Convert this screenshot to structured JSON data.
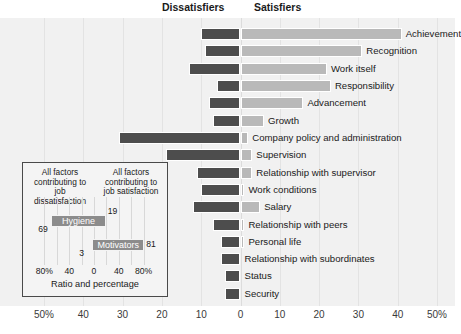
{
  "headers": {
    "dissatisfiers": "Dissatisfiers",
    "satisfiers": "Satisfiers"
  },
  "colors": {
    "negative_bar": "#4d4d4d",
    "positive_bar": "#b9b9b9",
    "plot_background": "#f1f1f1",
    "inset_bar": "#8c8c8c"
  },
  "chart_data": {
    "type": "bar",
    "title": "",
    "subtitle": "",
    "orientation": "horizontal",
    "stacked": "diverging",
    "xlabel": "",
    "ylabel": "",
    "xlim": [
      -55,
      55
    ],
    "grid": true,
    "legend_position": "top",
    "xticks": [
      "50%",
      "40",
      "30",
      "20",
      "10",
      "0",
      "10",
      "20",
      "30",
      "40",
      "50%"
    ],
    "xtick_values": [
      -50,
      -40,
      -30,
      -20,
      -10,
      0,
      10,
      20,
      30,
      40,
      50
    ],
    "categories": [
      "Achievement",
      "Recognition",
      "Work itself",
      "Responsibility",
      "Advancement",
      "Growth",
      "Company policy and administration",
      "Supervision",
      "Relationship with supervisor",
      "Work conditions",
      "Salary",
      "Relationship with peers",
      "Personal life",
      "Relationship with subordinates",
      "Status",
      "Security"
    ],
    "series": [
      {
        "name": "Dissatisfiers",
        "values": [
          -10,
          -9,
          -13,
          -6,
          -8,
          -7,
          -31,
          -19,
          -11,
          -10,
          -12,
          -7,
          -5,
          -5,
          -4,
          -4
        ]
      },
      {
        "name": "Satisfiers",
        "values": [
          41,
          31,
          22,
          23,
          16,
          6,
          2,
          3,
          3,
          1,
          5,
          1,
          1,
          0,
          0,
          0
        ]
      }
    ]
  },
  "inset": {
    "caption_left": "All factors contributing to job dissatisfaction",
    "caption_right": "All factors contributing to job satisfaction",
    "axis_label": "Ratio and percentage",
    "xticks": [
      "80%",
      "40",
      "0",
      "40",
      "80%"
    ],
    "xtick_values": [
      -80,
      -40,
      0,
      40,
      80
    ],
    "bars": [
      {
        "label": "Hygiene",
        "left_value": 69,
        "right_value": 19
      },
      {
        "label": "Motivators",
        "left_value": 3,
        "right_value": 81
      }
    ]
  }
}
